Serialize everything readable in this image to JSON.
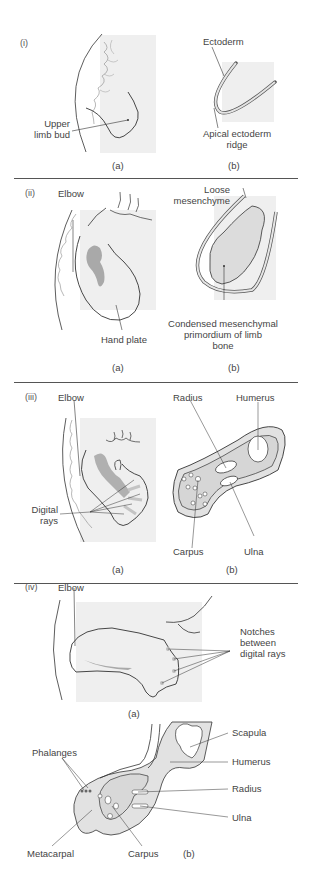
{
  "figure": {
    "stages": [
      {
        "id": "i",
        "label": "(i)",
        "panels": [
          {
            "id": "a",
            "label": "(a)",
            "annotations": [
              "Upper limb bud"
            ]
          },
          {
            "id": "b",
            "label": "(b)",
            "annotations": [
              "Ectoderm",
              "Apical ectoderm ridge"
            ]
          }
        ]
      },
      {
        "id": "ii",
        "label": "(ii)",
        "panels": [
          {
            "id": "a",
            "label": "(a)",
            "annotations": [
              "Elbow",
              "Hand plate"
            ]
          },
          {
            "id": "b",
            "label": "(b)",
            "annotations": [
              "Loose mesenchyme",
              "Condensed mesenchymal primordium of limb bone"
            ]
          }
        ]
      },
      {
        "id": "iii",
        "label": "(iii)",
        "panels": [
          {
            "id": "a",
            "label": "(a)",
            "annotations": [
              "Elbow",
              "Digital rays"
            ]
          },
          {
            "id": "b",
            "label": "(b)",
            "annotations": [
              "Radius",
              "Humerus",
              "Carpus",
              "Ulna"
            ]
          }
        ]
      },
      {
        "id": "iv",
        "label": "(iv)",
        "panels": [
          {
            "id": "a",
            "label": "(a)",
            "annotations": [
              "Elbow",
              "Notches between digital rays"
            ]
          },
          {
            "id": "b",
            "label": "(b)",
            "annotations": [
              "Scapula",
              "Humerus",
              "Radius",
              "Ulna",
              "Phalanges",
              "Metacarpal",
              "Carpus"
            ]
          }
        ]
      }
    ],
    "text": {
      "i_label": "(i)",
      "i_upper_limb_bud_1": "Upper",
      "i_upper_limb_bud_2": "limb bud",
      "i_ectoderm": "Ectoderm",
      "i_aer_1": "Apical ectoderm",
      "i_aer_2": "ridge",
      "ii_label": "(ii)",
      "ii_elbow": "Elbow",
      "ii_hand_plate": "Hand plate",
      "ii_loose_1": "Loose",
      "ii_loose_2": "mesenchyme",
      "ii_cond_1": "Condensed mesenchymal",
      "ii_cond_2": "primordium of limb",
      "ii_cond_3": "bone",
      "iii_label": "(iii)",
      "iii_elbow": "Elbow",
      "iii_digital_1": "Digital",
      "iii_digital_2": "rays",
      "iii_radius": "Radius",
      "iii_humerus": "Humerus",
      "iii_carpus": "Carpus",
      "iii_ulna": "Ulna",
      "iv_label": "(iv)",
      "iv_elbow": "Elbow",
      "iv_notches_1": "Notches",
      "iv_notches_2": "between",
      "iv_notches_3": "digital rays",
      "iv_scapula": "Scapula",
      "iv_humerus": "Humerus",
      "iv_radius": "Radius",
      "iv_ulna": "Ulna",
      "iv_phalanges": "Phalanges",
      "iv_metacarpal": "Metacarpal",
      "iv_carpus": "Carpus",
      "sub_a": "(a)",
      "sub_b": "(b)"
    },
    "colors": {
      "background_panel": "#efefef",
      "tissue_fill": "#e2e2e2",
      "condensation": "#a9a9a9",
      "line": "#333333"
    }
  }
}
